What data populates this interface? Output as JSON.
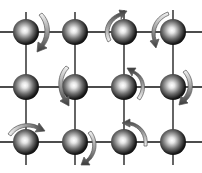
{
  "diagram": {
    "type": "lattice",
    "colors": {
      "background": "#ffffff",
      "bond": "#111111",
      "sphere_dark": "#0d0d0d",
      "sphere_light": "#ffffff",
      "arrow_dark": "#3a3a3a",
      "arrow_light": "#f2f2f2"
    },
    "columns_x": [
      26,
      75,
      124,
      173
    ],
    "rows_y": [
      32,
      87,
      142
    ],
    "sphere_radius": 13,
    "nodes": [
      {
        "row": 0,
        "col": 0,
        "x": 26,
        "y": 32
      },
      {
        "row": 0,
        "col": 1,
        "x": 75,
        "y": 32
      },
      {
        "row": 0,
        "col": 2,
        "x": 124,
        "y": 32
      },
      {
        "row": 0,
        "col": 3,
        "x": 173,
        "y": 32
      },
      {
        "row": 1,
        "col": 0,
        "x": 26,
        "y": 87
      },
      {
        "row": 1,
        "col": 1,
        "x": 75,
        "y": 87
      },
      {
        "row": 1,
        "col": 2,
        "x": 124,
        "y": 87
      },
      {
        "row": 1,
        "col": 3,
        "x": 173,
        "y": 87
      },
      {
        "row": 2,
        "col": 0,
        "x": 26,
        "y": 142
      },
      {
        "row": 2,
        "col": 1,
        "x": 75,
        "y": 142
      },
      {
        "row": 2,
        "col": 2,
        "x": 124,
        "y": 142
      },
      {
        "row": 2,
        "col": 3,
        "x": 173,
        "y": 142
      }
    ],
    "rotation_arrows": [
      {
        "node": "0,0",
        "side": "right",
        "direction": "down"
      },
      {
        "node": "0,2",
        "side": "upper-left",
        "direction": "up-right"
      },
      {
        "node": "0,3",
        "side": "left",
        "direction": "down"
      },
      {
        "node": "1,1",
        "side": "left",
        "direction": "down"
      },
      {
        "node": "1,2",
        "side": "right",
        "direction": "up"
      },
      {
        "node": "1,3",
        "side": "right",
        "direction": "down"
      },
      {
        "node": "2,0",
        "side": "top",
        "direction": "right"
      },
      {
        "node": "2,1",
        "side": "right",
        "direction": "down"
      },
      {
        "node": "2,2",
        "side": "upper-right",
        "direction": "up-left"
      }
    ]
  }
}
